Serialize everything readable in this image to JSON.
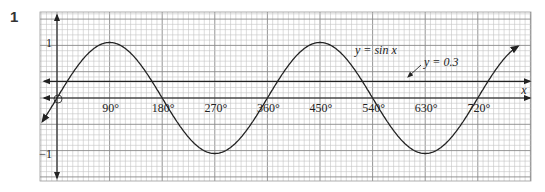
{
  "question_number": "1",
  "chart_data": {
    "type": "line",
    "title": "",
    "xlabel": "x",
    "ylabel": "",
    "x_tick_labels": [
      "90°",
      "180°",
      "270°",
      "360°",
      "450°",
      "540°",
      "630°",
      "720°"
    ],
    "x_ticks": [
      90,
      180,
      270,
      360,
      450,
      540,
      630,
      720
    ],
    "y_tick_labels": [
      "1",
      "−1"
    ],
    "y_ticks": [
      1,
      -1
    ],
    "origin_label": "O",
    "xlim": [
      -25,
      810
    ],
    "ylim": [
      -1.5,
      1.5
    ],
    "grid": true,
    "series": [
      {
        "name": "y = sin x",
        "label": "y = sin x",
        "function": "sin",
        "x": [
          -25,
          0,
          90,
          180,
          270,
          360,
          450,
          540,
          630,
          720,
          790
        ],
        "y": [
          -0.42,
          0,
          1,
          0,
          -1,
          0,
          1,
          0,
          -1,
          0,
          0.94
        ]
      },
      {
        "name": "y = 0.3",
        "label": "y = 0.3",
        "function": "constant",
        "x": [
          -25,
          810
        ],
        "y": [
          0.3,
          0.3
        ]
      }
    ],
    "annotations": [
      {
        "text": "y = sin x",
        "x": 395,
        "y": 0.72
      },
      {
        "text": "y = 0.3",
        "x": 560,
        "y": 0.55,
        "arrow_to": [
          500,
          0.3
        ]
      }
    ]
  }
}
